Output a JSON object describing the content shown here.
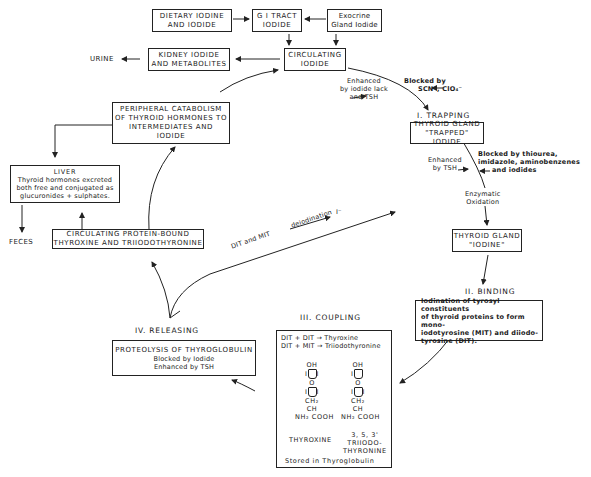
{
  "diagram": {
    "top": {
      "dietary": [
        "DIETARY IODINE",
        "AND IODIDE"
      ],
      "gi_tract": [
        "G I TRACT",
        "IODIDE"
      ],
      "exocrine": [
        "Exocrine",
        "Gland Iodide"
      ],
      "kidney": [
        "KIDNEY IODIDE",
        "AND METABOLITES"
      ],
      "urine": "URINE",
      "circulating_iodide": [
        "CIRCULATING",
        "IODIDE"
      ]
    },
    "trapping": {
      "enhanced": [
        "Enhanced",
        "by iodide lack",
        "and  TSH"
      ],
      "blocked": [
        "Blocked by",
        "SCN⁻, ClO₄⁻"
      ],
      "heading": "I. TRAPPING",
      "box": [
        "THYROID GLAND",
        "\"TRAPPED\" IODIDE"
      ]
    },
    "oxidation": {
      "enhanced": [
        "Enhanced",
        "by TSH"
      ],
      "blocked": [
        "Blocked by thiourea,",
        "imidazole, aminobenzenes",
        "and  iodides"
      ],
      "label": [
        "Enzymatic",
        "Oxidation"
      ],
      "box": [
        "THYROID GLAND",
        "\"IODINE\""
      ]
    },
    "binding": {
      "heading": "II. BINDING",
      "box": [
        "Iodination of tyrosyl constituents",
        "of thyroid proteins to form mono-",
        "iodotyrosine (MIT) and diiodo-",
        "tyrosine (DIT)."
      ]
    },
    "coupling": {
      "heading": "III. COUPLING",
      "reactions": [
        "DIT + DIT → Thyroxine",
        "DIT + MIT → Triiodothyronine"
      ],
      "thyroxine": {
        "oh": "OH",
        "i": "I",
        "o": "O",
        "ch2": "CH₂",
        "ch": "CH",
        "nh2_cooh": "NH₂  COOH",
        "name": "THYROXINE"
      },
      "triiodo": {
        "oh": "OH",
        "i": "I",
        "o": "O",
        "ch2": "CH₂",
        "ch": "CH",
        "nh2_cooh": "NH₂  COOH",
        "name": [
          "3, 5, 3'",
          "TRIIODO-",
          "THYRONINE"
        ]
      },
      "stored": "Stored in Thyroglobulin"
    },
    "releasing": {
      "heading": "IV. RELEASING",
      "box": [
        "PROTEOLYSIS  OF  THYROGLOBULIN",
        "Blocked by Iodide",
        "Enhanced  by TSH"
      ]
    },
    "deiodination": {
      "left": "DIT  and  MIT",
      "over": "deiodination",
      "product": "I⁻"
    },
    "protein_bound": [
      "CIRCULATING  PROTEIN-BOUND",
      "THYROXINE  AND  TRIIODOTHYRONINE"
    ],
    "peripheral": [
      "PERIPHERAL  CATABOLISM",
      "OF  THYROID HORMONES TO",
      "INTERMEDIATES  AND",
      "IODIDE"
    ],
    "liver": {
      "title": "LIVER",
      "text": [
        "Thyroid hormones excreted",
        "both free and conjugated as",
        "glucuronides + sulphates."
      ]
    },
    "feces": "FECES"
  }
}
